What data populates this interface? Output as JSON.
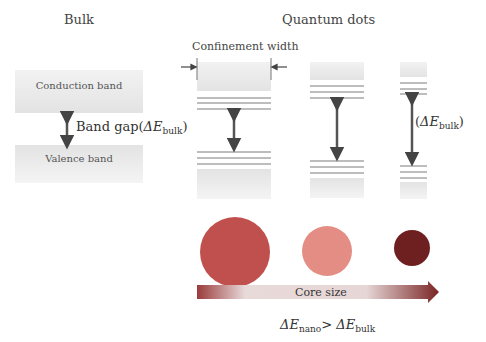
{
  "bulk": {
    "title": "Bulk",
    "conduction_band": "Conduction band",
    "valence_band": "Valence band",
    "band_gap_label": "Band gap(",
    "band_gap_var": "ΔE",
    "band_gap_sub": "bulk",
    "band_gap_close": ")"
  },
  "quantum_dots": {
    "title": "Quantum dots",
    "confinement_label": "Confinement width",
    "gap_label_open": "(",
    "gap_label_var": "ΔE",
    "gap_label_sub": "bulk",
    "gap_label_close": ")"
  },
  "core_size": {
    "arrow_label": "Core size",
    "circles": [
      {
        "size": "large",
        "color": "#c0504d"
      },
      {
        "size": "medium",
        "color": "#e48d84"
      },
      {
        "size": "small",
        "color": "#6e1f1f"
      }
    ]
  },
  "relation": {
    "lhs_var": "ΔE",
    "lhs_sub": "nano",
    "op": ">",
    "rhs_var": "ΔE",
    "rhs_sub": "bulk"
  }
}
